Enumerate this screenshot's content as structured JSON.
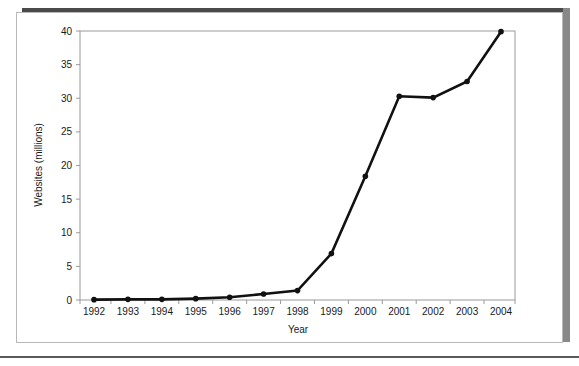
{
  "figure": {
    "frame_color": "#b8b8b8",
    "shadow_color": "#4a4a4a",
    "background": "#ffffff"
  },
  "chart_data": {
    "type": "line",
    "title": "",
    "xlabel": "Year",
    "ylabel": "Websites (millions)",
    "categories": [
      "1992",
      "1993",
      "1994",
      "1995",
      "1996",
      "1997",
      "1998",
      "1999",
      "2000",
      "2001",
      "2002",
      "2003",
      "2004"
    ],
    "x": [
      1992,
      1993,
      1994,
      1995,
      1996,
      1997,
      1998,
      1999,
      2000,
      2001,
      2002,
      2003,
      2004
    ],
    "values": [
      0.05,
      0.1,
      0.1,
      0.2,
      0.4,
      0.9,
      1.4,
      6.9,
      18.4,
      30.3,
      30.1,
      32.5,
      39.9
    ],
    "series": [
      {
        "name": "Websites",
        "color": "#111111",
        "marker": "circle",
        "values": [
          0.05,
          0.1,
          0.1,
          0.2,
          0.4,
          0.9,
          1.4,
          6.9,
          18.4,
          30.3,
          30.1,
          32.5,
          39.9
        ]
      }
    ],
    "ylim": [
      0,
      40
    ],
    "yticks": [
      0,
      5,
      10,
      15,
      20,
      25,
      30,
      35,
      40
    ],
    "ytick_labels": [
      "0",
      "5",
      "10",
      "15",
      "20",
      "25",
      "30",
      "35",
      "40"
    ],
    "xtick_labels": [
      "1992",
      "1993",
      "1994",
      "1995",
      "1996",
      "1997",
      "1998",
      "1999",
      "2000",
      "2001",
      "2002",
      "2003",
      "2004"
    ],
    "grid": false,
    "legend": false,
    "legend_position": "none"
  }
}
